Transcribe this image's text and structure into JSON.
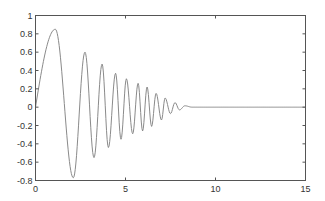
{
  "chart_data": {
    "type": "line",
    "title": "",
    "xlabel": "",
    "ylabel": "",
    "xlim": [
      0,
      15
    ],
    "ylim": [
      -0.8,
      1
    ],
    "grid": false,
    "legend": null,
    "x_ticks": [
      0,
      5,
      10,
      15
    ],
    "x_tick_labels": [
      "0",
      "5",
      "10",
      "15"
    ],
    "y_ticks": [
      -0.8,
      -0.6,
      -0.4,
      -0.2,
      0,
      0.2,
      0.4,
      0.6,
      0.8,
      1
    ],
    "y_tick_labels": [
      "-0.8",
      "-0.6",
      "-0.4",
      "-0.2",
      "0",
      "0.2",
      "0.4",
      "0.6",
      "0.8",
      "1"
    ],
    "series": [
      {
        "name": "damped oscillation",
        "color": "#8a8a8a",
        "extrema": [
          [
            0,
            0
          ],
          [
            1.1,
            0.85
          ],
          [
            2.1,
            -0.77
          ],
          [
            2.75,
            0.6
          ],
          [
            3.25,
            -0.55
          ],
          [
            3.7,
            0.47
          ],
          [
            4.05,
            -0.44
          ],
          [
            4.45,
            0.37
          ],
          [
            4.75,
            -0.35
          ],
          [
            5.05,
            0.31
          ],
          [
            5.4,
            -0.29
          ],
          [
            5.7,
            0.26
          ],
          [
            5.95,
            -0.26
          ],
          [
            6.2,
            0.22
          ],
          [
            6.45,
            -0.21
          ],
          [
            6.7,
            0.15
          ],
          [
            7.0,
            -0.14
          ],
          [
            7.2,
            0.1
          ],
          [
            7.5,
            -0.07
          ],
          [
            7.75,
            0.05
          ],
          [
            8.0,
            -0.03
          ],
          [
            8.3,
            0.015
          ],
          [
            8.7,
            0
          ],
          [
            15,
            0
          ]
        ]
      }
    ]
  },
  "colors": {
    "axis": "#555555",
    "line": "#8a8a8a",
    "background": "#ffffff"
  }
}
